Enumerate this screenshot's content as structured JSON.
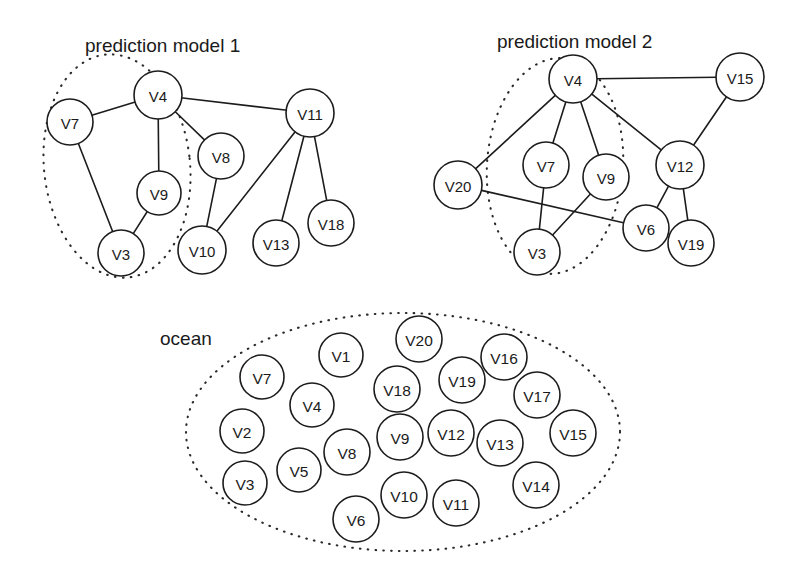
{
  "figure": {
    "background_color": "#ffffff",
    "stroke_color": "#1c1c1c",
    "node_fill": "#ffffff",
    "groups": [
      {
        "id": "prediction-model-1",
        "title": "prediction model 1",
        "title_x": 85,
        "title_y": 52,
        "boundary": {
          "cx": 117,
          "cy": 166,
          "rx": 73,
          "ry": 112,
          "rotate": -6
        },
        "nodes": [
          {
            "id": "V7",
            "label": "V7",
            "x": 70,
            "y": 122,
            "r": 23
          },
          {
            "id": "V4",
            "label": "V4",
            "x": 158,
            "y": 95,
            "r": 24
          },
          {
            "id": "V9",
            "label": "V9",
            "x": 159,
            "y": 193,
            "r": 22
          },
          {
            "id": "V3",
            "label": "V3",
            "x": 121,
            "y": 253,
            "r": 23
          },
          {
            "id": "V8",
            "label": "V8",
            "x": 221,
            "y": 156,
            "r": 23
          },
          {
            "id": "V10",
            "label": "V10",
            "x": 202,
            "y": 250,
            "r": 24
          },
          {
            "id": "V11",
            "label": "V11",
            "x": 310,
            "y": 113,
            "r": 24
          },
          {
            "id": "V13",
            "label": "V13",
            "x": 276,
            "y": 243,
            "r": 23
          },
          {
            "id": "V18",
            "label": "V18",
            "x": 331,
            "y": 223,
            "r": 23
          }
        ],
        "edges": [
          [
            "V7",
            "V4"
          ],
          [
            "V7",
            "V3"
          ],
          [
            "V4",
            "V9"
          ],
          [
            "V4",
            "V8"
          ],
          [
            "V4",
            "V11"
          ],
          [
            "V9",
            "V3"
          ],
          [
            "V8",
            "V10"
          ],
          [
            "V11",
            "V10"
          ],
          [
            "V11",
            "V13"
          ],
          [
            "V11",
            "V18"
          ]
        ]
      },
      {
        "id": "prediction-model-2",
        "title": "prediction model 2",
        "title_x": 497,
        "title_y": 48,
        "boundary": {
          "cx": 555,
          "cy": 166,
          "rx": 68,
          "ry": 108,
          "rotate": 4
        },
        "nodes": [
          {
            "id": "V4",
            "label": "V4",
            "x": 573,
            "y": 79,
            "r": 24
          },
          {
            "id": "V20",
            "label": "V20",
            "x": 458,
            "y": 185,
            "r": 24
          },
          {
            "id": "V7",
            "label": "V7",
            "x": 546,
            "y": 165,
            "r": 23
          },
          {
            "id": "V9",
            "label": "V9",
            "x": 606,
            "y": 177,
            "r": 23
          },
          {
            "id": "V3",
            "label": "V3",
            "x": 537,
            "y": 252,
            "r": 23
          },
          {
            "id": "V6",
            "label": "V6",
            "x": 646,
            "y": 228,
            "r": 23
          },
          {
            "id": "V12",
            "label": "V12",
            "x": 680,
            "y": 165,
            "r": 24
          },
          {
            "id": "V15",
            "label": "V15",
            "x": 740,
            "y": 77,
            "r": 24
          },
          {
            "id": "V19",
            "label": "V19",
            "x": 691,
            "y": 243,
            "r": 23
          }
        ],
        "edges": [
          [
            "V4",
            "V20"
          ],
          [
            "V4",
            "V7"
          ],
          [
            "V4",
            "V9"
          ],
          [
            "V4",
            "V15"
          ],
          [
            "V4",
            "V12"
          ],
          [
            "V7",
            "V3"
          ],
          [
            "V9",
            "V3"
          ],
          [
            "V20",
            "V6"
          ],
          [
            "V12",
            "V15"
          ],
          [
            "V12",
            "V6"
          ],
          [
            "V12",
            "V19"
          ]
        ]
      },
      {
        "id": "ocean",
        "title": "ocean",
        "title_x": 160,
        "title_y": 345,
        "boundary": {
          "cx": 403,
          "cy": 432,
          "rx": 217,
          "ry": 119,
          "rotate": 0
        },
        "nodes": [
          {
            "id": "V7",
            "label": "V7",
            "x": 262,
            "y": 377,
            "r": 22
          },
          {
            "id": "V1",
            "label": "V1",
            "x": 341,
            "y": 355,
            "r": 22
          },
          {
            "id": "V20",
            "label": "V20",
            "x": 419,
            "y": 339,
            "r": 23
          },
          {
            "id": "V16",
            "label": "V16",
            "x": 504,
            "y": 357,
            "r": 23
          },
          {
            "id": "V18",
            "label": "V18",
            "x": 397,
            "y": 389,
            "r": 23
          },
          {
            "id": "V19",
            "label": "V19",
            "x": 462,
            "y": 380,
            "r": 23
          },
          {
            "id": "V17",
            "label": "V17",
            "x": 537,
            "y": 395,
            "r": 23
          },
          {
            "id": "V4",
            "label": "V4",
            "x": 312,
            "y": 405,
            "r": 22
          },
          {
            "id": "V2",
            "label": "V2",
            "x": 242,
            "y": 431,
            "r": 22
          },
          {
            "id": "V9",
            "label": "V9",
            "x": 400,
            "y": 437,
            "r": 23
          },
          {
            "id": "V12",
            "label": "V12",
            "x": 451,
            "y": 433,
            "r": 23
          },
          {
            "id": "V13",
            "label": "V13",
            "x": 500,
            "y": 443,
            "r": 23
          },
          {
            "id": "V15",
            "label": "V15",
            "x": 573,
            "y": 433,
            "r": 23
          },
          {
            "id": "V8",
            "label": "V8",
            "x": 347,
            "y": 452,
            "r": 23
          },
          {
            "id": "V5",
            "label": "V5",
            "x": 299,
            "y": 470,
            "r": 22
          },
          {
            "id": "V3",
            "label": "V3",
            "x": 245,
            "y": 483,
            "r": 22
          },
          {
            "id": "V14",
            "label": "V14",
            "x": 536,
            "y": 485,
            "r": 23
          },
          {
            "id": "V10",
            "label": "V10",
            "x": 404,
            "y": 495,
            "r": 23
          },
          {
            "id": "V11",
            "label": "V11",
            "x": 456,
            "y": 503,
            "r": 23
          },
          {
            "id": "V6",
            "label": "V6",
            "x": 356,
            "y": 519,
            "r": 23
          }
        ],
        "edges": []
      }
    ]
  }
}
